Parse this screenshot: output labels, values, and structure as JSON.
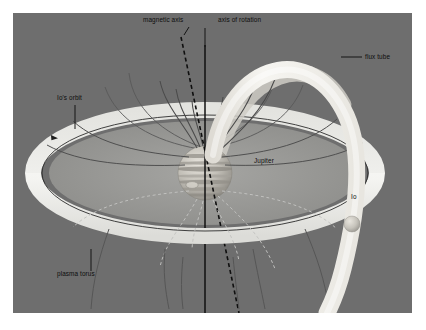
{
  "figure": {
    "kind": "scientific-diagram",
    "background_color": "#6e6e6e",
    "panel_border_color": "#ffffff"
  },
  "labels": {
    "magnetic_axis": "magnetic axis",
    "axis_of_rotation": "axis of rotation",
    "flux_tube": "flux tube",
    "ios_orbit": "Io's orbit",
    "jupiter": "Jupiter",
    "io": "Io",
    "plasma_torus": "plasma torus"
  },
  "colors": {
    "background": "#6e6e6e",
    "torus_bright": "#f2f2f0",
    "torus_inner": "#9b9b99",
    "torus_shadow": "#8a8a88",
    "flux_tube": "#ededea",
    "planet_light": "#d9d6cf",
    "planet_mid": "#b3b0a8",
    "planet_dark": "#8e8b84",
    "field_line": "#4a4a4a",
    "field_line_hidden": "#bdbdbd",
    "axis_line": "#111111",
    "label_text": "#121212",
    "io_body": "#c9c6bf"
  },
  "elements": {
    "planet": {
      "name": "Jupiter",
      "cx": 192,
      "cy": 160,
      "r": 27,
      "has_great_red_spot": true,
      "band_count": 7
    },
    "io": {
      "name": "Io",
      "cx": 339,
      "cy": 211,
      "r": 8
    },
    "plasma_torus": {
      "rx": 172,
      "ry": 63,
      "band_thickness": 16,
      "tilt_degrees": -4
    },
    "ios_orbit": {
      "rx": 163,
      "ry": 58,
      "direction_marker": "arrow"
    },
    "flux_tube": {
      "description": "bright tube connecting Jupiter polar region to Io",
      "width": 17
    },
    "axis_of_rotation": {
      "style": "solid",
      "x_top": 192,
      "y_top": 32,
      "x_bottom": 192,
      "y_bottom": 300
    },
    "magnetic_axis": {
      "style": "dashed",
      "tilt_degrees": 10
    },
    "field_lines": {
      "visible_count": 12,
      "hidden_count": 8
    }
  },
  "label_positions": {
    "magnetic_axis": {
      "x": 130,
      "y": 19
    },
    "axis_of_rotation": {
      "x": 205,
      "y": 19
    },
    "flux_tube": {
      "x": 363,
      "y": 52
    },
    "ios_orbit": {
      "x": 57,
      "y": 97
    },
    "jupiter": {
      "x": 243,
      "y": 161
    },
    "io": {
      "x": 340,
      "y": 196
    },
    "plasma_torus": {
      "x": 46,
      "y": 268
    }
  }
}
